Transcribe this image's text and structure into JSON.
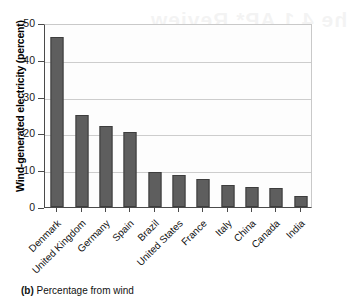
{
  "figure": {
    "caption_label": "(b)",
    "caption_text": "Percentage from wind",
    "bleed_through": {
      "line1": "he 4.1 AP* Review",
      "line2": "Multiple-Choice"
    }
  },
  "chart_data": {
    "type": "bar",
    "title": "",
    "subtitle": "",
    "xlabel": "",
    "ylabel": "Wind-generated electricity (percent)",
    "ylim": [
      0,
      50
    ],
    "yticks": [
      0,
      10,
      20,
      30,
      40,
      50
    ],
    "ytick_labels": [
      "0",
      "10",
      "20",
      "30",
      "40",
      "50"
    ],
    "grid": true,
    "grid_axis": "y",
    "legend": false,
    "bar_color": "#5e5e5e",
    "bar_edge_color": "#3d3d3d",
    "categories": [
      "Denmark",
      "United Kingdom",
      "Germany",
      "Spain",
      "Brazil",
      "United States",
      "France",
      "Italy",
      "China",
      "Canada",
      "India"
    ],
    "values": [
      46.3,
      25.0,
      22.0,
      20.4,
      9.5,
      8.7,
      7.6,
      6.0,
      5.4,
      5.2,
      3.0
    ]
  }
}
